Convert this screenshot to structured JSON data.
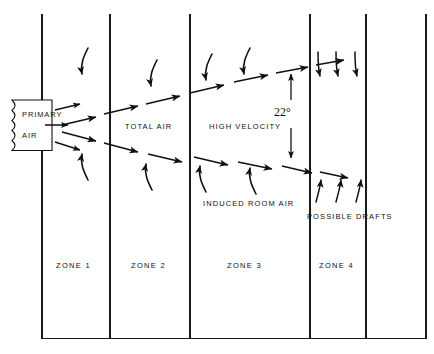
{
  "diagram": {
    "source_box": {
      "line1": "PRIMARY",
      "line2": "AIR",
      "shape": "broken-edge-rectangle"
    },
    "stream_labels": [
      {
        "text": "TOTAL AIR",
        "x": 125,
        "y": 122
      },
      {
        "text": "HIGH VELOCITY",
        "x": 209,
        "y": 122
      },
      {
        "text": "INDUCED ROOM AIR",
        "x": 203,
        "y": 201
      },
      {
        "text": "POSSIBLE DRAFTS",
        "x": 308,
        "y": 214
      }
    ],
    "angle_annotation": {
      "value": "22",
      "unit": "°",
      "text": "22°",
      "x": 283,
      "y": 112,
      "dimension_line_x": 291,
      "dimension_top_y": 73,
      "dimension_bottom_y": 160
    },
    "zones": [
      {
        "label": "ZONE 1",
        "x": 73,
        "y": 265
      },
      {
        "label": "ZONE 2",
        "x": 150,
        "y": 265
      },
      {
        "label": "ZONE 3",
        "x": 249,
        "y": 265
      },
      {
        "label": "ZONE 4",
        "x": 337,
        "y": 265
      }
    ],
    "dividers": {
      "description": "vertical zone boundary lines",
      "x_positions": [
        42,
        110,
        190,
        310,
        366,
        426
      ],
      "top_y": 14,
      "bottom_y": 338
    },
    "baseline": {
      "description": "bottom horizontal frame line",
      "y": 338,
      "x_start": 42,
      "x_end": 426
    },
    "cone": {
      "apex_x": 52,
      "apex_y": 128,
      "upper_end_x": 330,
      "upper_end_y": 68,
      "lower_end_x": 330,
      "lower_end_y": 170,
      "style": "dashed-with-arrowheads"
    },
    "colors": {
      "ink": "#111111",
      "background": "#ffffff",
      "line": "#000000"
    }
  }
}
